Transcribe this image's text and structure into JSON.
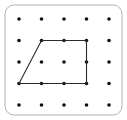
{
  "figure": {
    "name": "geoboard-trapezoid",
    "background_color": "#ffffff"
  },
  "board": {
    "frame": {
      "x": 5,
      "y": 5,
      "width": 117,
      "height": 110,
      "corner_radius": 9,
      "stroke_color": "#b3b3b3",
      "stroke_width": 1,
      "fill_color": "#ffffff"
    },
    "grid": {
      "rows": 5,
      "columns": 5,
      "origin_x": 19,
      "origin_y": 19,
      "spacing_x": 22.5,
      "spacing_y": 21.5,
      "dot_radius": 1.8,
      "dot_color": "#111111"
    }
  },
  "chart_data": {
    "type": "scatter",
    "xlabel": "",
    "ylabel": "",
    "xlim": [
      0,
      4
    ],
    "ylim": [
      0,
      4
    ],
    "grid": false,
    "legend": "none",
    "peg_columns": [
      0,
      1,
      2,
      3,
      4
    ],
    "peg_rows": [
      0,
      1,
      2,
      3,
      4
    ],
    "pegs": [
      {
        "col": 0,
        "row": 0
      },
      {
        "col": 1,
        "row": 0
      },
      {
        "col": 2,
        "row": 0
      },
      {
        "col": 3,
        "row": 0
      },
      {
        "col": 4,
        "row": 0
      },
      {
        "col": 0,
        "row": 1
      },
      {
        "col": 1,
        "row": 1
      },
      {
        "col": 2,
        "row": 1
      },
      {
        "col": 3,
        "row": 1
      },
      {
        "col": 4,
        "row": 1
      },
      {
        "col": 0,
        "row": 2
      },
      {
        "col": 1,
        "row": 2
      },
      {
        "col": 2,
        "row": 2
      },
      {
        "col": 3,
        "row": 2
      },
      {
        "col": 4,
        "row": 2
      },
      {
        "col": 0,
        "row": 3
      },
      {
        "col": 1,
        "row": 3
      },
      {
        "col": 2,
        "row": 3
      },
      {
        "col": 3,
        "row": 3
      },
      {
        "col": 4,
        "row": 3
      },
      {
        "col": 0,
        "row": 4
      },
      {
        "col": 1,
        "row": 4
      },
      {
        "col": 2,
        "row": 4
      },
      {
        "col": 3,
        "row": 4
      },
      {
        "col": 4,
        "row": 4
      }
    ],
    "shapes": [
      {
        "name": "trapezoid",
        "closed": true,
        "stroke_color": "#2b2b2b",
        "fill": "none",
        "vertices_grid": [
          {
            "col": 0,
            "row": 3
          },
          {
            "col": 1,
            "row": 1
          },
          {
            "col": 3,
            "row": 1
          },
          {
            "col": 3,
            "row": 3
          }
        ]
      }
    ]
  }
}
